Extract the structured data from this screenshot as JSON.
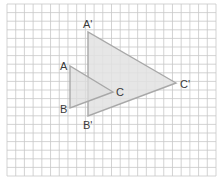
{
  "figure": {
    "grid": {
      "x0": 7,
      "y0": 4,
      "x1": 216,
      "y1": 176,
      "cols": 24,
      "rows": 20,
      "line_color": "#c8c8c8"
    },
    "triangle_original": {
      "name": "ABC",
      "fill": "#dedede",
      "stroke": "#a8a8a8",
      "vertices": {
        "A": {
          "x": 70,
          "y": 66
        },
        "B": {
          "x": 70,
          "y": 108
        },
        "C": {
          "x": 113,
          "y": 92
        }
      }
    },
    "triangle_image": {
      "name": "A'B'C'",
      "fill": "#e2e2e2",
      "stroke": "#a8a8a8",
      "vertices": {
        "A'": {
          "x": 88,
          "y": 32
        },
        "B'": {
          "x": 88,
          "y": 116
        },
        "C'": {
          "x": 176,
          "y": 83
        }
      }
    },
    "labels": {
      "A": "A",
      "B": "B",
      "C": "C",
      "A_prime": "A'",
      "B_prime": "B'",
      "C_prime": "C'"
    }
  }
}
